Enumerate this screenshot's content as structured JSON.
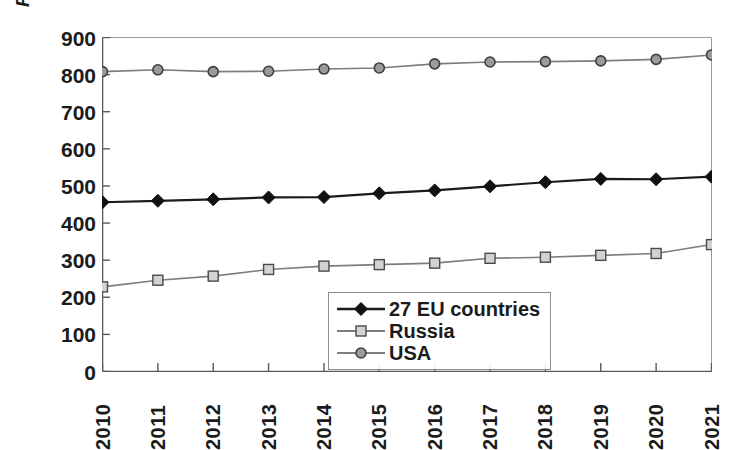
{
  "chart_data": {
    "type": "line",
    "title": "",
    "xlabel": "",
    "ylabel": "Passanger cars per 1000 inhabitans",
    "categories": [
      "2010",
      "2011",
      "2012",
      "2013",
      "2014",
      "2015",
      "2016",
      "2017",
      "2018",
      "2019",
      "2020",
      "2021"
    ],
    "x": [
      2010,
      2011,
      2012,
      2013,
      2014,
      2015,
      2016,
      2017,
      2018,
      2019,
      2020,
      2021
    ],
    "ylim": [
      0,
      900
    ],
    "yticks": [
      0,
      100,
      200,
      300,
      400,
      500,
      600,
      700,
      800,
      900
    ],
    "grid": false,
    "legend_position": "inside-bottom-right",
    "series": [
      {
        "name": "27 EU countries",
        "marker": "diamond",
        "color": "#1b1b1b",
        "values": [
          456,
          460,
          464,
          469,
          470,
          480,
          488,
          499,
          510,
          519,
          518,
          525
        ]
      },
      {
        "name": "Russia",
        "marker": "square",
        "color": "#7a7a7a",
        "values": [
          228,
          246,
          257,
          275,
          284,
          288,
          292,
          305,
          308,
          313,
          318,
          342
        ]
      },
      {
        "name": "USA",
        "marker": "circle",
        "color": "#6e6e6e",
        "values": [
          808,
          813,
          808,
          809,
          815,
          818,
          829,
          834,
          835,
          837,
          841,
          853
        ]
      }
    ]
  },
  "axes": {
    "y_tick_labels": [
      "900",
      "800",
      "700",
      "600",
      "500",
      "400",
      "300",
      "200",
      "100",
      "0"
    ],
    "x_tick_labels": [
      "2010",
      "2011",
      "2012",
      "2013",
      "2014",
      "2015",
      "2016",
      "2017",
      "2018",
      "2019",
      "2020",
      "2021"
    ],
    "y_axis_title": "Passanger cars per 1000 inhabitans"
  },
  "legend": {
    "items": [
      {
        "label": "27 EU countries",
        "marker": "diamond",
        "color": "#1b1b1b"
      },
      {
        "label": "Russia",
        "marker": "square",
        "color": "#7a7a7a"
      },
      {
        "label": "USA",
        "marker": "circle",
        "color": "#6e6e6e"
      }
    ]
  }
}
